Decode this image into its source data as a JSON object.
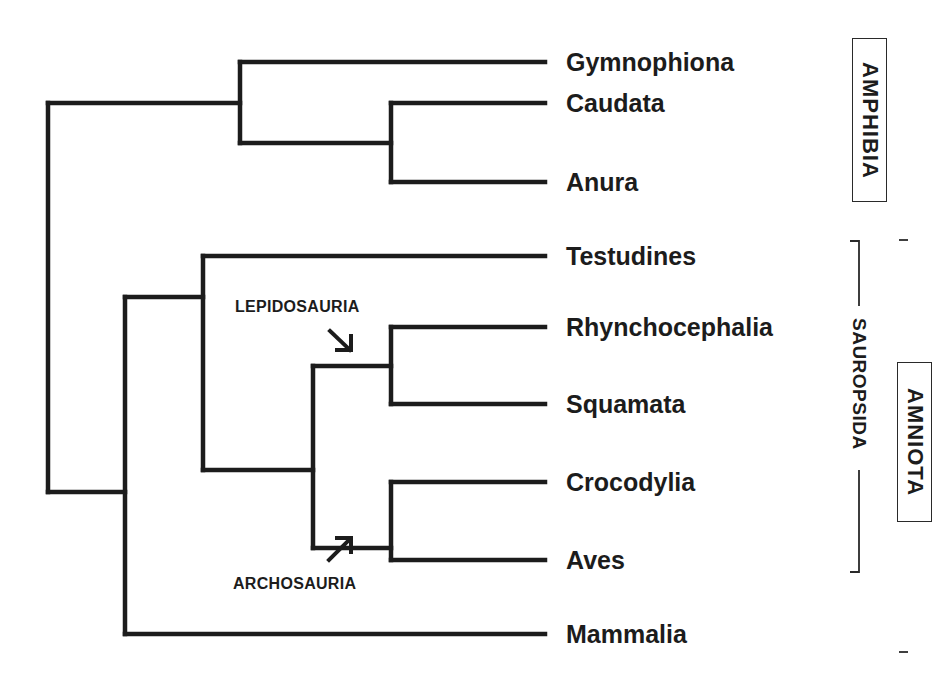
{
  "diagram": {
    "type": "phylogenetic-tree",
    "line_color": "#1c1c1c",
    "taxa": [
      {
        "name": "Gymnophiona",
        "y": 62
      },
      {
        "name": "Caudata",
        "y": 103
      },
      {
        "name": "Anura",
        "y": 182
      },
      {
        "name": "Testudines",
        "y": 256
      },
      {
        "name": "Rhynchocephalia",
        "y": 327
      },
      {
        "name": "Squamata",
        "y": 404
      },
      {
        "name": "Crocodylia",
        "y": 482
      },
      {
        "name": "Aves",
        "y": 560
      },
      {
        "name": "Mammalia",
        "y": 634
      }
    ],
    "internal_labels": {
      "lepidosauria": "LEPIDOSAURIA",
      "archosauria": "ARCHOSAURIA"
    },
    "groups": {
      "amphibia": "AMPHIBIA",
      "sauropsida": "SAUROPSIDA",
      "amniota": "AMNIOTA"
    },
    "topology": "((Gymnophiona,(Caudata,Anura)),((Testudines,((Rhynchocephalia,Squamata)Lepidosauria,(Crocodylia,Aves)Archosauria)),Mammalia))"
  }
}
